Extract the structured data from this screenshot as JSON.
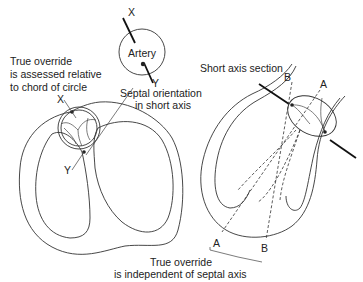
{
  "figure": {
    "left_panel": {
      "caption_true_override": [
        "True override",
        "is assessed relative",
        "to chord of circle"
      ],
      "artery_label": "Artery",
      "axis_labels": {
        "top_x": "X",
        "bottom_y": "Y",
        "inner_x": "X",
        "inner_y": "Y"
      },
      "septal_caption": [
        "Septal orientation",
        "in short axis"
      ]
    },
    "right_panel": {
      "section_caption": "Short axis section",
      "axis_labels": {
        "top_b": "B",
        "top_a": "A",
        "bottom_a": "A",
        "bottom_b": "B"
      },
      "bottom_caption": [
        "True override",
        "is independent of septal axis"
      ]
    },
    "colors": {
      "line": "#333333",
      "background": "#ffffff"
    }
  }
}
